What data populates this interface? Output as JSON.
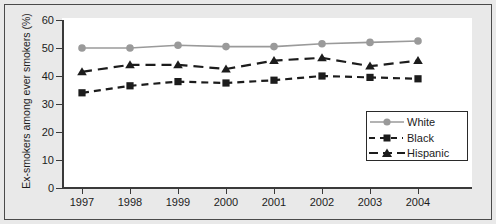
{
  "chart_data": {
    "type": "line",
    "title": "",
    "subtitle": "",
    "xlabel": "",
    "ylabel": "Ex-smokers among ever smokers (%)",
    "categories": [
      "1997",
      "1998",
      "1999",
      "2000",
      "2001",
      "2002",
      "2003",
      "2004"
    ],
    "x": [
      1997,
      1998,
      1999,
      2000,
      2001,
      2002,
      2003,
      2004
    ],
    "ylim": [
      0,
      60
    ],
    "yticks": [
      0,
      10,
      20,
      30,
      40,
      50,
      60
    ],
    "ytick_labels": [
      "0",
      "10",
      "20",
      "30",
      "40",
      "50",
      "60"
    ],
    "grid": false,
    "legend_position": "bottom-right",
    "series": [
      {
        "name": "White",
        "values": [
          50.0,
          50.0,
          51.0,
          50.5,
          50.5,
          51.5,
          52.0,
          52.5
        ],
        "color": "#9a9a9a",
        "marker": "circle",
        "linestyle": "solid"
      },
      {
        "name": "Black",
        "values": [
          34.0,
          36.5,
          38.0,
          37.5,
          38.5,
          40.0,
          39.5,
          39.0
        ],
        "color": "#1c1c1c",
        "marker": "square",
        "linestyle": "dotted-dash"
      },
      {
        "name": "Hispanic",
        "values": [
          41.5,
          44.0,
          44.0,
          42.5,
          45.5,
          46.5,
          43.5,
          45.5
        ],
        "color": "#1c1c1c",
        "marker": "triangle",
        "linestyle": "dashed"
      }
    ]
  },
  "legend": {
    "entries": [
      {
        "label": "White"
      },
      {
        "label": "Black"
      },
      {
        "label": "Hispanic"
      }
    ]
  },
  "colors": {
    "background": "#e9e9e9",
    "plot_background": "#ffffff",
    "frame": "#4a4a4a",
    "axis": "#3a3a3a",
    "white_series": "#9a9a9a",
    "black_series": "#1c1c1c",
    "hispanic_series": "#1c1c1c"
  }
}
